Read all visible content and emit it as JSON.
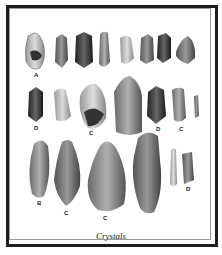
{
  "figure": {
    "caption": "Crystals",
    "labels": {
      "row1_a": "A",
      "row2_d1": "D",
      "row2_c1": "C",
      "row2_d2": "D",
      "row2_c2": "C",
      "row3_b": "B",
      "row3_c1": "C",
      "row3_c2": "C",
      "row3_d": "D"
    }
  }
}
